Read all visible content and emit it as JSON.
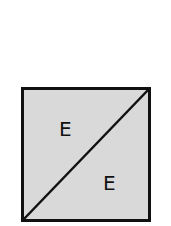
{
  "diagram": {
    "shape": "square-divided-by-diagonal",
    "fill_color": "#d9d9d9",
    "stroke_color": "#111111",
    "regions": [
      {
        "position": "upper-left triangle",
        "label": "E"
      },
      {
        "position": "lower-right triangle",
        "label": "E"
      }
    ]
  }
}
